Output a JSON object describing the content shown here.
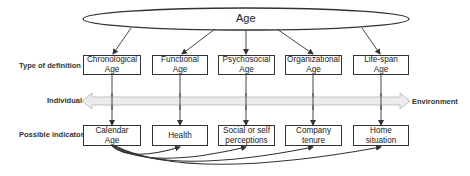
{
  "root": {
    "label": "Age"
  },
  "row_labels": {
    "definition": "Type of definition",
    "indicators": "Possible indicators"
  },
  "continuum": {
    "left": "Individual",
    "right": "Environment"
  },
  "definitions": [
    {
      "label": "Chronological\nAge"
    },
    {
      "label": "Functional\nAge"
    },
    {
      "label": "Psychosocial\nAge"
    },
    {
      "label": "Organizational\nAge"
    },
    {
      "label": "Life-span\nAge"
    }
  ],
  "indicators": [
    {
      "label": "Calendar\nAge"
    },
    {
      "label": "Health"
    },
    {
      "label": "Social or self\nperceptions"
    },
    {
      "label": "Company\ntenure"
    },
    {
      "label": "Home\nsituation"
    }
  ],
  "colors": {
    "stroke": "#333333",
    "arrow_fill": "#ebebeb",
    "text": "#222222"
  }
}
